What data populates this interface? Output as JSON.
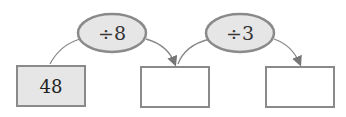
{
  "diagram": {
    "type": "arrow-chain",
    "boxes": [
      {
        "value": "48",
        "filled": true
      },
      {
        "value": "",
        "filled": false
      },
      {
        "value": "",
        "filled": false
      }
    ],
    "operations": [
      {
        "label": "÷8"
      },
      {
        "label": "÷3"
      }
    ],
    "colors": {
      "fill": "#e6e6e6",
      "stroke": "#8a8a8a",
      "arrow": "#777777"
    }
  }
}
